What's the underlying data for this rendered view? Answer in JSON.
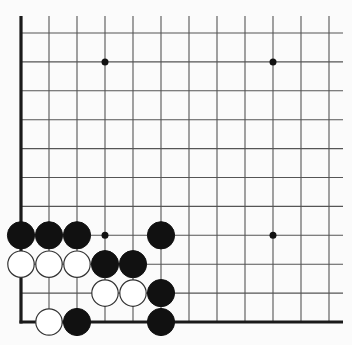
{
  "diagram": {
    "type": "go-board-corner",
    "visible_columns": 12,
    "visible_rows": 11,
    "edges": [
      "left",
      "bottom"
    ],
    "colors": {
      "background": "#fbfbfb",
      "grid_line": "#555555",
      "edge_line": "#1a1a1a",
      "black_stone": "#111111",
      "white_stone": "#ffffff",
      "white_stone_outline": "#333333",
      "hoshi": "#111111"
    },
    "geometry": {
      "origin_x": 21,
      "origin_y": 33,
      "step_x": 28,
      "step_y": 28.9,
      "line_end_x": 343,
      "line_top_y": 16,
      "stone_radius": 13.6,
      "hoshi_radius": 3.5
    },
    "hoshi": [
      {
        "col": 3,
        "row": 1
      },
      {
        "col": 9,
        "row": 1
      },
      {
        "col": 3,
        "row": 7
      },
      {
        "col": 9,
        "row": 7
      }
    ],
    "stones": [
      {
        "color": "black",
        "col": 0,
        "row": 7
      },
      {
        "color": "black",
        "col": 1,
        "row": 7
      },
      {
        "color": "black",
        "col": 2,
        "row": 7
      },
      {
        "color": "black",
        "col": 5,
        "row": 7
      },
      {
        "color": "white",
        "col": 0,
        "row": 8
      },
      {
        "color": "white",
        "col": 1,
        "row": 8
      },
      {
        "color": "white",
        "col": 2,
        "row": 8
      },
      {
        "color": "black",
        "col": 3,
        "row": 8
      },
      {
        "color": "black",
        "col": 4,
        "row": 8
      },
      {
        "color": "white",
        "col": 3,
        "row": 9
      },
      {
        "color": "white",
        "col": 4,
        "row": 9
      },
      {
        "color": "black",
        "col": 5,
        "row": 9
      },
      {
        "color": "white",
        "col": 1,
        "row": 10
      },
      {
        "color": "black",
        "col": 2,
        "row": 10
      },
      {
        "color": "black",
        "col": 5,
        "row": 10
      }
    ]
  }
}
